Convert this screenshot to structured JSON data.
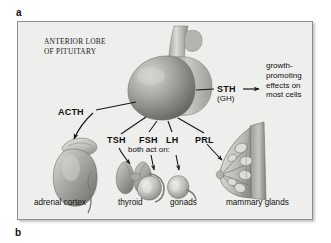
{
  "figure": {
    "panel_markers": {
      "top": "a",
      "bottom": "b"
    },
    "title": {
      "line1": "ANTERIOR LOBE",
      "line2": "OF PITUITARY"
    },
    "hormones": [
      {
        "id": "acth",
        "label": "ACTH",
        "target": "adrenal cortex"
      },
      {
        "id": "tsh",
        "label": "TSH",
        "target": "thyroid"
      },
      {
        "id": "fsh",
        "label": "FSH",
        "target": "gonads"
      },
      {
        "id": "lh",
        "label": "LH",
        "target": "gonads"
      },
      {
        "id": "prl",
        "label": "PRL",
        "target": "mammary glands"
      },
      {
        "id": "sth",
        "label": "STH",
        "target": "most cells"
      }
    ],
    "sth_alias": "(GH)",
    "sth_effect": "growth-promoting effects on most cells",
    "both_act_on_note": "both act on:",
    "organ_labels": [
      "adrenal cortex",
      "thyroid",
      "gonads",
      "mammary glands"
    ],
    "colors": {
      "panel_background": "#eeeeec",
      "panel_border": "#8c8c8c",
      "text": "#111111",
      "illustration_mid": "#9a9a98",
      "illustration_dark": "#6b6b69",
      "illustration_light": "#d8d8d5"
    }
  }
}
